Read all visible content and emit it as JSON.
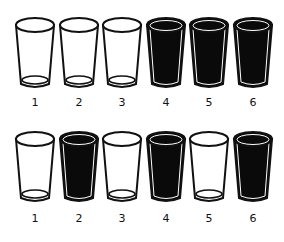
{
  "diagram": {
    "colors": {
      "filled": "#0a0a0a",
      "empty": "#ffffff",
      "outline": "#111111"
    },
    "rows": [
      {
        "name": "top-row",
        "glasses": [
          {
            "label": "1",
            "state": "empty"
          },
          {
            "label": "2",
            "state": "empty"
          },
          {
            "label": "3",
            "state": "empty"
          },
          {
            "label": "4",
            "state": "full"
          },
          {
            "label": "5",
            "state": "full"
          },
          {
            "label": "6",
            "state": "full"
          }
        ]
      },
      {
        "name": "bottom-row",
        "glasses": [
          {
            "label": "1",
            "state": "empty"
          },
          {
            "label": "2",
            "state": "full"
          },
          {
            "label": "3",
            "state": "empty"
          },
          {
            "label": "4",
            "state": "full"
          },
          {
            "label": "5",
            "state": "empty"
          },
          {
            "label": "6",
            "state": "full"
          }
        ]
      }
    ]
  }
}
